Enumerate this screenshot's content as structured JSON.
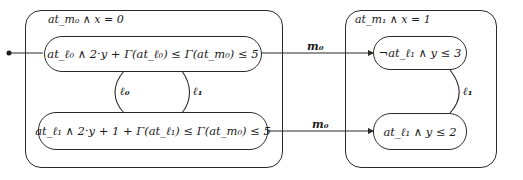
{
  "diagram": {
    "type": "state-diagram",
    "containers": [
      {
        "id": "m0",
        "label": "at_m₀ ∧ x = 0"
      },
      {
        "id": "m1",
        "label": "at_m₁ ∧ x = 1"
      }
    ],
    "nodes": [
      {
        "id": "n1",
        "container": "m0",
        "label": "at_ℓ₀ ∧ 2·y + Γ(at_ℓ₀) ≤ Γ(at_m₀) ≤ 5",
        "initial": true
      },
      {
        "id": "n2",
        "container": "m0",
        "label": "at_ℓ₁ ∧ 2·y + 1 + Γ(at_ℓ₁) ≤ Γ(at_m₀) ≤ 5"
      },
      {
        "id": "n3",
        "container": "m1",
        "label": "¬at_ℓ₁ ∧ y ≤ 3"
      },
      {
        "id": "n4",
        "container": "m1",
        "label": "at_ℓ₁ ∧ y ≤ 2"
      }
    ],
    "edges": [
      {
        "from": "n1",
        "to": "n2",
        "label": "ℓ₀"
      },
      {
        "from": "n2",
        "to": "n1",
        "label": "ℓ₁"
      },
      {
        "from": "n1",
        "to": "n3",
        "label": "m₀"
      },
      {
        "from": "n2",
        "to": "n4",
        "label": "m₀"
      },
      {
        "from": "n3",
        "to": "n4",
        "label": "ℓ₁"
      }
    ]
  }
}
